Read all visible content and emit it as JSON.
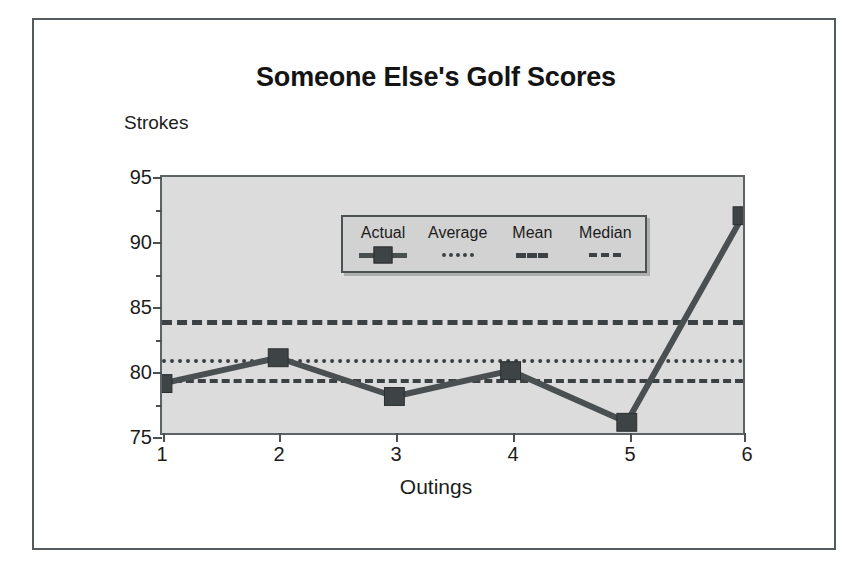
{
  "chart_data": {
    "type": "line",
    "title": "Someone Else's Golf Scores",
    "xlabel": "Outings",
    "ylabel": "Strokes",
    "x": [
      1,
      2,
      3,
      4,
      5,
      6
    ],
    "xtick_labels": [
      "1",
      "2",
      "3",
      "4",
      "5",
      "6"
    ],
    "ytick_labels": [
      "75",
      "80",
      "85",
      "90",
      "95"
    ],
    "ytick_values": [
      75,
      80,
      85,
      90,
      95
    ],
    "yminor_values": [
      77.5,
      82.5,
      87.5,
      92.5
    ],
    "ylim": [
      75,
      95
    ],
    "xlim": [
      1,
      6
    ],
    "grid": false,
    "legend_position": "top-center-inside",
    "series": [
      {
        "name": "Actual",
        "style": "solid-marker-square",
        "values": [
          79,
          81,
          78,
          80,
          76,
          92
        ]
      },
      {
        "name": "Average",
        "style": "dotted",
        "type": "reference-line",
        "value": 81
      },
      {
        "name": "Mean",
        "style": "dashed-long",
        "type": "reference-line",
        "value": 84
      },
      {
        "name": "Median",
        "style": "dashed-short",
        "type": "reference-line",
        "value": 79.5
      }
    ],
    "colors": {
      "series_line": "#4a4f52",
      "marker_fill": "#3e4346",
      "reference_line": "#3c4144",
      "plot_background": "#dcdcdc",
      "axis": "#5d6265",
      "frame": "#555b5e",
      "legend_background": "#d2d2d2",
      "text": "#1c1c1c"
    }
  },
  "legend": {
    "items": [
      {
        "label": "Actual",
        "icon": "square-marker-line-icon"
      },
      {
        "label": "Average",
        "icon": "dotted-line-icon"
      },
      {
        "label": "Mean",
        "icon": "dashed-line-icon"
      },
      {
        "label": "Median",
        "icon": "short-dashed-line-icon"
      }
    ]
  }
}
